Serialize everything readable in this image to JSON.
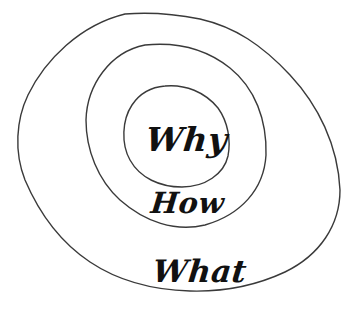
{
  "diagram": {
    "type": "golden-circle",
    "rings": [
      {
        "name": "inner",
        "label": "Why"
      },
      {
        "name": "middle",
        "label": "How"
      },
      {
        "name": "outer",
        "label": "What"
      }
    ],
    "stroke_color": "#3a3a3a",
    "text_color": "#111111",
    "background": "#ffffff"
  }
}
